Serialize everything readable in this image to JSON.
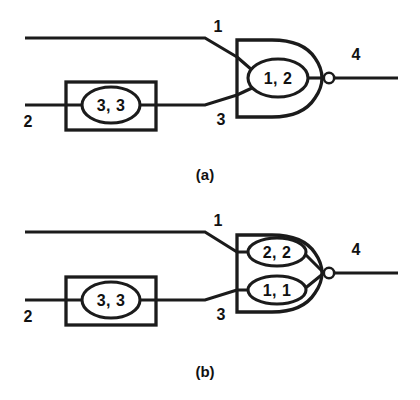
{
  "figure": {
    "background_color": "#ffffff",
    "ink_color": "#1b1b1b",
    "panels": [
      {
        "id": "a",
        "caption": "(a)",
        "pins": {
          "input_top": "1",
          "input_bottom_source": "2",
          "input_bottom_gate": "3",
          "output": "4"
        },
        "buffer_node": {
          "label": "3, 3",
          "shape": "ellipse-in-rectangle"
        },
        "gate": {
          "type": "nand",
          "has_output_bubble": true,
          "nodes": [
            {
              "label": "1, 2"
            }
          ]
        }
      },
      {
        "id": "b",
        "caption": "(b)",
        "pins": {
          "input_top": "1",
          "input_bottom_source": "2",
          "input_bottom_gate": "3",
          "output": "4"
        },
        "buffer_node": {
          "label": "3, 3",
          "shape": "ellipse-in-rectangle"
        },
        "gate": {
          "type": "nand",
          "has_output_bubble": true,
          "nodes": [
            {
              "label": "2, 2"
            },
            {
              "label": "1, 1"
            }
          ]
        }
      }
    ]
  }
}
